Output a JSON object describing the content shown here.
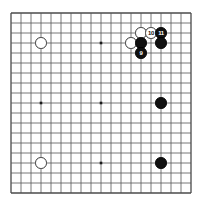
{
  "figure": {
    "type": "go-board-diagram",
    "title": "",
    "board_size": 19,
    "background_color": "#ffffff",
    "line_color": "#555555",
    "border_color": "#4a4a4a",
    "black_color": "#111111",
    "white_color": "#ffffff"
  },
  "board": {
    "columns": 19,
    "rows": 19,
    "star_points": [
      {
        "col": 4,
        "row": 4
      },
      {
        "col": 10,
        "row": 4
      },
      {
        "col": 16,
        "row": 4
      },
      {
        "col": 4,
        "row": 10
      },
      {
        "col": 10,
        "row": 10
      },
      {
        "col": 16,
        "row": 10
      },
      {
        "col": 4,
        "row": 16
      },
      {
        "col": 10,
        "row": 16
      },
      {
        "col": 16,
        "row": 16
      }
    ]
  },
  "stones": [
    {
      "id": "white-upper-left",
      "color": "white",
      "col": 4,
      "row": 4,
      "label": ""
    },
    {
      "id": "white-lower-left",
      "color": "white",
      "col": 4,
      "row": 16,
      "label": ""
    },
    {
      "id": "black-right-center",
      "color": "black",
      "col": 16,
      "row": 10,
      "label": ""
    },
    {
      "id": "black-lower-right",
      "color": "black",
      "col": 16,
      "row": 16,
      "label": ""
    },
    {
      "id": "white-corner-a",
      "color": "white",
      "col": 14,
      "row": 3,
      "label": ""
    },
    {
      "id": "white-corner-b",
      "color": "white",
      "col": 13,
      "row": 4,
      "label": ""
    },
    {
      "id": "black-corner-a",
      "color": "black",
      "col": 14,
      "row": 4,
      "label": ""
    },
    {
      "id": "black-move-9",
      "color": "black",
      "col": 14,
      "row": 5,
      "label": "9"
    },
    {
      "id": "white-move-10",
      "color": "white",
      "col": 15,
      "row": 3,
      "label": "10"
    },
    {
      "id": "black-move-11",
      "color": "black",
      "col": 16,
      "row": 3,
      "label": "11"
    },
    {
      "id": "black-corner-b",
      "color": "black",
      "col": 16,
      "row": 4,
      "label": ""
    }
  ],
  "move_labels": {
    "move_9": "9",
    "move_10": "10",
    "move_11": "11"
  }
}
